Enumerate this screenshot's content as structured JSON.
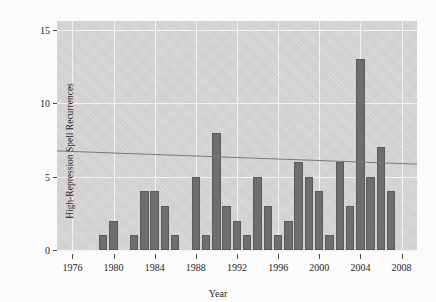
{
  "chart_data": {
    "type": "bar",
    "title": "",
    "xlabel": "Year",
    "ylabel": "High-Repression Spell Recurrences",
    "xlim": [
      1974.5,
      2009.5
    ],
    "ylim": [
      0,
      15.6
    ],
    "grid": true,
    "legend": null,
    "xticks": [
      1976,
      1980,
      1984,
      1988,
      1992,
      1996,
      2000,
      2004,
      2008
    ],
    "xticklabels": [
      "1976",
      "1980",
      "1984",
      "1988",
      "1992",
      "1996",
      "2000",
      "2004",
      "2008"
    ],
    "yticks": [
      0,
      5,
      10,
      15
    ],
    "yticklabels": [
      "0",
      "5",
      "10",
      "15"
    ],
    "categories": [
      1979,
      1980,
      1982,
      1983,
      1984,
      1985,
      1986,
      1988,
      1989,
      1990,
      1991,
      1992,
      1993,
      1994,
      1995,
      1996,
      1997,
      1998,
      1999,
      2000,
      2001,
      2002,
      2003,
      2004,
      2005,
      2006,
      2007
    ],
    "values": [
      1,
      2,
      1,
      4,
      4,
      3,
      1,
      5,
      1,
      8,
      3,
      2,
      1,
      5,
      3,
      1,
      2,
      6,
      5,
      4,
      1,
      6,
      3,
      13,
      5,
      7,
      4
    ],
    "annotations": [
      {
        "type": "trendline",
        "x": [
          1974.5,
          2009.5
        ],
        "y": [
          6.75,
          5.85
        ],
        "style": "solid",
        "color": "#7a7a7a"
      }
    ],
    "panel_color": "#d2d2d2",
    "bar_color": "#6e6e6e",
    "gridline_color": "#f4f4f4"
  }
}
